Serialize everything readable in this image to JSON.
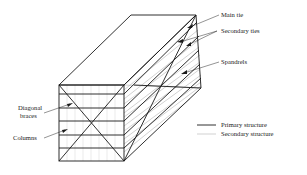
{
  "diagram": {
    "title": "",
    "labels": {
      "main_tie": "Main tie",
      "secondary_ties": "Secondary ties",
      "spandrels": "Spandrels",
      "diagonal_braces_line1": "Diagonal",
      "diagonal_braces_line2": "braces",
      "columns": "Columns"
    },
    "legend": [
      {
        "label": "Primary structure",
        "style": "thick-dark-line"
      },
      {
        "label": "Secondary structure",
        "style": "thin-grey-line"
      }
    ],
    "colors": {
      "primary": "#1a1a1a",
      "secondary": "#9a9a9a",
      "background": "#ffffff"
    }
  }
}
